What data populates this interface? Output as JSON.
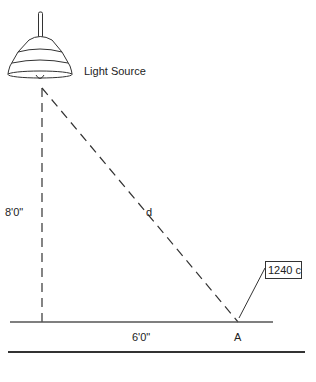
{
  "diagram": {
    "light_source_label": "Light Source",
    "height_label": "8'0\"",
    "distance_label": "d",
    "horizontal_label": "6'0\"",
    "point_label": "A",
    "illuminance_label": "1240 c",
    "colors": {
      "stroke": "#333333",
      "text": "#222222",
      "background": "#ffffff"
    }
  }
}
